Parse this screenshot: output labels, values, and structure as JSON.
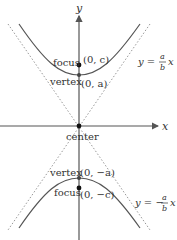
{
  "diagram": {
    "axes": {
      "x_label": "x",
      "y_label": "y"
    },
    "center": {
      "label": "center",
      "point": "(0, 0)"
    },
    "upper_branch": {
      "vertex_label": "vertex",
      "vertex_coord": "(0, a)",
      "focus_label": "focus",
      "focus_coord": "(0, c)"
    },
    "lower_branch": {
      "vertex_label": "vertex",
      "vertex_coord": "(0, −a)",
      "focus_label": "focus",
      "focus_coord": "(0, −c)"
    },
    "asymptotes": {
      "positive": {
        "lhs": "y =",
        "num": "a",
        "den": "b",
        "var": "x"
      },
      "negative": {
        "lhs": "y = −",
        "num": "a",
        "den": "b",
        "var": "x"
      }
    },
    "colors": {
      "curve": "#555555",
      "axis": "#555555",
      "asymptote": "#999999",
      "point": "#111111",
      "text": "#333333"
    }
  }
}
